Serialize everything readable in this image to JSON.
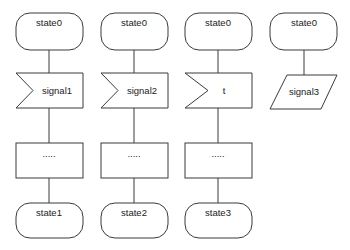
{
  "diagram": {
    "type": "SDL state transition flowchart",
    "columns": [
      {
        "start_state": "state0",
        "trigger_kind": "input-signal",
        "trigger_label": "signal1",
        "task_label": ".....",
        "end_state": "state1"
      },
      {
        "start_state": "state0",
        "trigger_kind": "input-signal",
        "trigger_label": "signal2",
        "task_label": ".....",
        "end_state": "state2"
      },
      {
        "start_state": "state0",
        "trigger_kind": "input-signal",
        "trigger_label": "t",
        "task_label": ".....",
        "end_state": "state3"
      },
      {
        "start_state": "state0",
        "trigger_kind": "parallelogram",
        "trigger_label": "signal3"
      }
    ],
    "colors": {
      "stroke": "#3a3a3a",
      "fill": "#ffffff",
      "text": "#222222"
    }
  }
}
